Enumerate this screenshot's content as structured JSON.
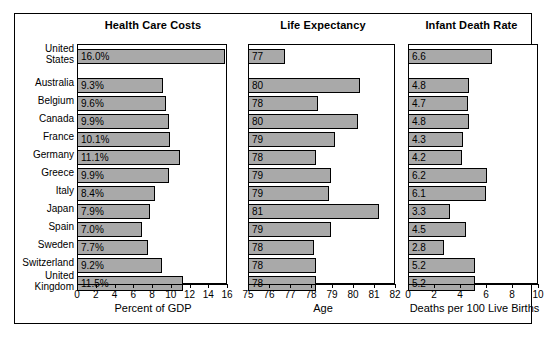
{
  "chart_data": {
    "type": "bar",
    "orientation": "horizontal",
    "title": "",
    "categories": [
      "United States",
      "Australia",
      "Belgium",
      "Canada",
      "France",
      "Germany",
      "Greece",
      "Italy",
      "Japan",
      "Spain",
      "Sweden",
      "Switzerland",
      "United Kingdom"
    ],
    "category_lines": [
      [
        "United",
        "States"
      ],
      [
        "Australia"
      ],
      [
        "Belgium"
      ],
      [
        "Canada"
      ],
      [
        "France"
      ],
      [
        "Germany"
      ],
      [
        "Greece"
      ],
      [
        "Italy"
      ],
      [
        "Japan"
      ],
      [
        "Spain"
      ],
      [
        "Sweden"
      ],
      [
        "Switzerland"
      ],
      [
        "United",
        "Kingdom"
      ]
    ],
    "grid": false,
    "legend": "none",
    "bar_color": "#a9a9a9",
    "bar_edge_color": "#000000",
    "panels": [
      {
        "title": "Health Care Costs",
        "xlabel": "Percent of GDP",
        "xlim": [
          0,
          16
        ],
        "xticks": [
          0,
          2,
          4,
          6,
          8,
          10,
          12,
          14,
          16
        ],
        "values": [
          16.0,
          9.3,
          9.6,
          9.9,
          10.1,
          11.1,
          9.9,
          8.4,
          7.9,
          7.0,
          7.7,
          9.2,
          11.5
        ],
        "labels": [
          "16.0%",
          "9.3%",
          "9.6%",
          "9.9%",
          "10.1%",
          "11.1%",
          "9.9%",
          "8.4%",
          "7.9%",
          "7.0%",
          "7.7%",
          "9.2%",
          "11.5%"
        ]
      },
      {
        "title": "Life Expectancy",
        "xlabel": "Age",
        "xlim": [
          75,
          82
        ],
        "xticks": [
          75,
          76,
          77,
          78,
          79,
          80,
          81,
          82
        ],
        "values": [
          76.8,
          80.4,
          78.4,
          80.3,
          79.2,
          78.3,
          79.0,
          78.9,
          81.3,
          79.0,
          78.2,
          78.3,
          78.3
        ],
        "labels": [
          "77",
          "80",
          "78",
          "80",
          "79",
          "78",
          "79",
          "79",
          "81",
          "79",
          "78",
          "78",
          "78"
        ]
      },
      {
        "title": "Infant Death Rate",
        "xlabel": "Deaths per 100 Live Births",
        "xlim": [
          0,
          10
        ],
        "xticks": [
          0,
          2,
          4,
          6,
          8,
          10
        ],
        "values": [
          6.6,
          4.8,
          4.7,
          4.8,
          4.3,
          4.2,
          6.2,
          6.1,
          3.3,
          4.5,
          2.8,
          5.2,
          5.2
        ],
        "labels": [
          "6.6",
          "4.8",
          "4.7",
          "4.8",
          "4.3",
          "4.2",
          "6.2",
          "6.1",
          "3.3",
          "4.5",
          "2.8",
          "5.2",
          "5.2"
        ]
      }
    ]
  }
}
